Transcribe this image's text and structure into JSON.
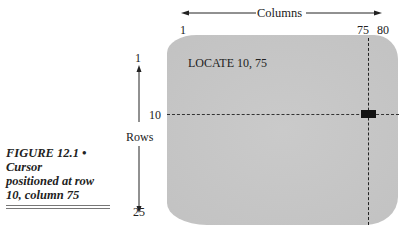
{
  "diagram": {
    "columns_axis": {
      "label": "Columns",
      "tick_labels": [
        "1",
        "75",
        "80"
      ]
    },
    "rows_axis": {
      "label": "Rows",
      "tick_labels": [
        "1",
        "10",
        "25"
      ]
    },
    "screen": {
      "text": "LOCATE 10, 75",
      "cursor_row": 10,
      "cursor_column": 75
    },
    "colors": {
      "screen": "#c6c6c6",
      "cursor": "#111111",
      "lines": "#222222"
    }
  },
  "caption": {
    "title": "FIGURE 12.1 •",
    "line2": "Cursor",
    "line3": "positioned at row",
    "line4": "10, column 75"
  }
}
